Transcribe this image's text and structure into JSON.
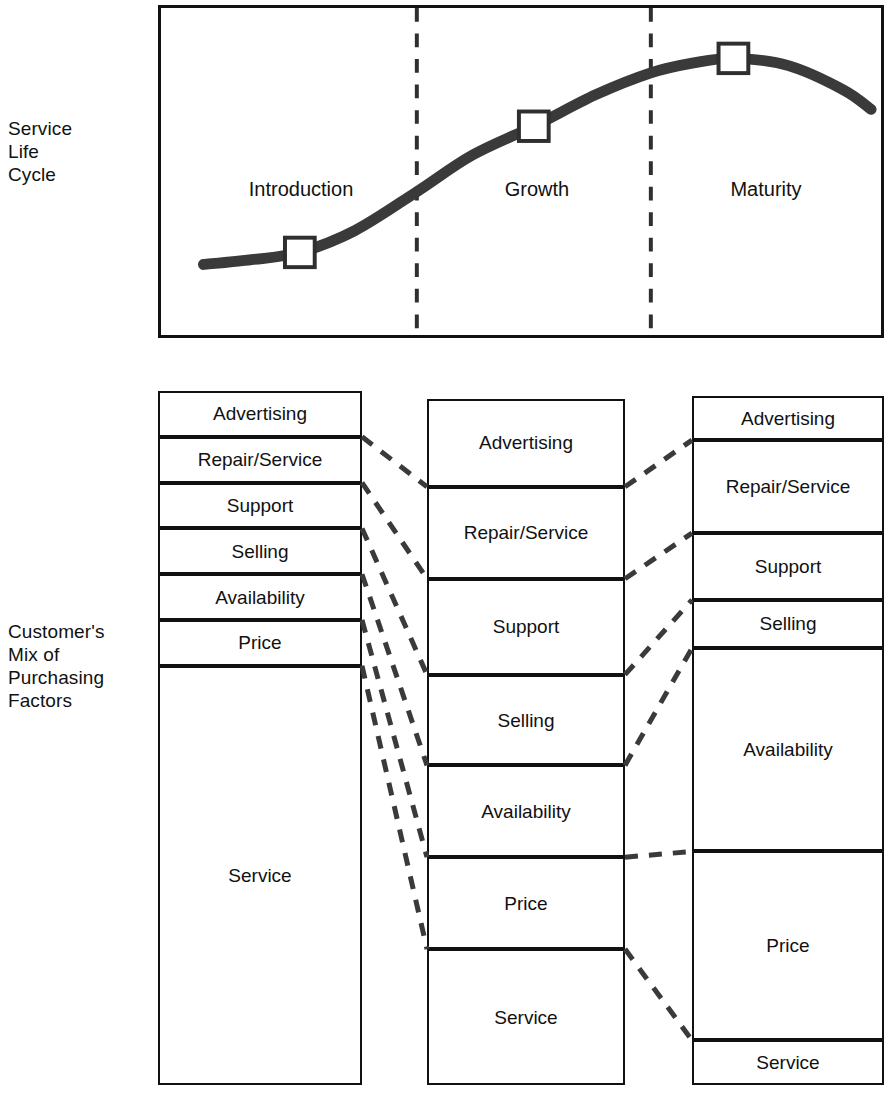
{
  "captions": {
    "life_cycle": "Service\nLife\nCycle",
    "purchasing_mix": "Customer's\nMix of\nPurchasing\nFactors"
  },
  "chart_data": {
    "type": "line",
    "title": "Service Life Cycle",
    "xlabel": "",
    "ylabel": "",
    "grid": false,
    "legend": null,
    "phases": [
      "Introduction",
      "Growth",
      "Maturity"
    ],
    "phase_boundaries_x": [
      0.34,
      0.68
    ],
    "markers": [
      {
        "label": "Introduction",
        "x": 0.17,
        "y": 0.13
      },
      {
        "label": "Growth",
        "x": 0.51,
        "y": 0.65
      },
      {
        "label": "Maturity",
        "x": 0.8,
        "y": 0.93
      }
    ],
    "x": [
      0.03,
      0.1,
      0.17,
      0.25,
      0.34,
      0.42,
      0.51,
      0.6,
      0.68,
      0.74,
      0.8,
      0.88,
      0.96,
      1.0
    ],
    "y": [
      0.08,
      0.1,
      0.13,
      0.22,
      0.38,
      0.53,
      0.65,
      0.78,
      0.87,
      0.91,
      0.93,
      0.9,
      0.8,
      0.72
    ],
    "curve_description": "S-shaped service life cycle curve rising through Introduction and Growth, peaking in Maturity and declining."
  },
  "factor_columns": [
    {
      "name": "introduction",
      "phase": "Introduction",
      "segments": [
        {
          "label": "Advertising",
          "share": 6.6
        },
        {
          "label": "Repair/Service",
          "share": 6.6
        },
        {
          "label": "Support",
          "share": 6.6
        },
        {
          "label": "Selling",
          "share": 6.6
        },
        {
          "label": "Availability",
          "share": 6.6
        },
        {
          "label": "Price",
          "share": 6.6
        },
        {
          "label": "Service",
          "share": 60.4
        }
      ]
    },
    {
      "name": "growth",
      "phase": "Growth",
      "segments": [
        {
          "label": "Advertising",
          "share": 12.8
        },
        {
          "label": "Repair/Service",
          "share": 13.4
        },
        {
          "label": "Support",
          "share": 14.0
        },
        {
          "label": "Selling",
          "share": 13.2
        },
        {
          "label": "Availability",
          "share": 13.4
        },
        {
          "label": "Price",
          "share": 13.4
        },
        {
          "label": "Service",
          "share": 19.8
        }
      ]
    },
    {
      "name": "maturity",
      "phase": "Maturity",
      "segments": [
        {
          "label": "Advertising",
          "share": 6.4
        },
        {
          "label": "Repair/Service",
          "share": 13.5
        },
        {
          "label": "Support",
          "share": 9.7
        },
        {
          "label": "Selling",
          "share": 7.0
        },
        {
          "label": "Availability",
          "share": 29.5
        },
        {
          "label": "Price",
          "share": 27.4
        },
        {
          "label": "Service",
          "share": 6.5
        }
      ]
    }
  ],
  "colors": {
    "line": "#2f2f2f",
    "border": "#111111",
    "dashed": "#3a3a3a",
    "background": "#ffffff"
  }
}
